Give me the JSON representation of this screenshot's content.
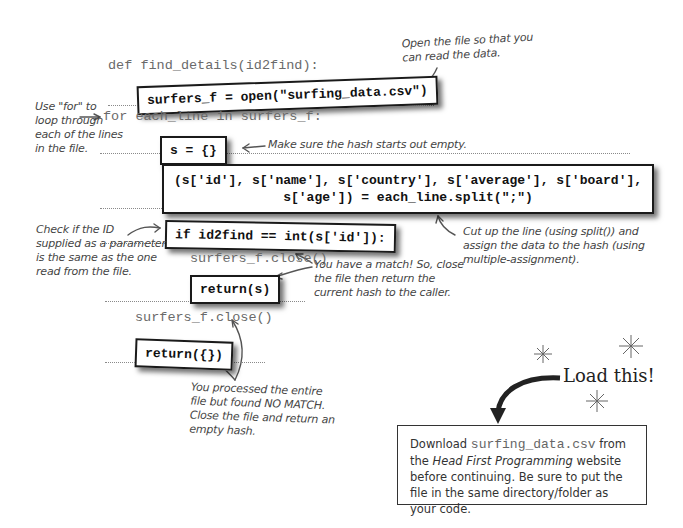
{
  "code": {
    "def_line": "def find_details(id2find):",
    "open_box": "surfers_f = open(\"surfing_data.csv\")",
    "for_line": "for each_line in surfers_f:",
    "hash_init_box": "s = {}",
    "split_box_line1": "(s['id'], s['name'], s['country'], s['average'], s['board'],",
    "split_box_line2": "              s['age']) = each_line.split(\";\")",
    "if_box": "if id2find == int(s['id']):",
    "close_inner": "surfers_f.close()",
    "return_s_box": "return(s)",
    "close_outer": "surfers_f.close()",
    "return_empty_box": "return({})"
  },
  "annotations": {
    "open_file": [
      "Open the file so that you",
      "can read the data."
    ],
    "use_for": [
      "Use \"for\" to",
      "loop through",
      "each of the lines",
      "in the file."
    ],
    "hash_empty": "Make sure the hash starts out empty.",
    "cut_line": [
      "Cut up the line (using split()) and",
      "assign the data to the hash (using",
      "multiple-assignment)."
    ],
    "check_id": [
      "Check if the ID",
      "supplied as a parameter",
      "is the same as the one",
      "read from the file."
    ],
    "match": [
      "You have a match! So, close",
      "the file then return the",
      "current hash to the caller."
    ],
    "no_match": [
      "You processed the entire",
      "file but found NO MATCH.",
      "Close the file and return an",
      "empty hash."
    ]
  },
  "callout": {
    "title": "Load this!",
    "text_before": "Download ",
    "filename": "surfing_data.csv",
    "text_after_file": " from the ",
    "book_title": "Head First Programming",
    "text_rest": " website before continuing. Be sure to put the file in the same directory/folder as your code."
  }
}
